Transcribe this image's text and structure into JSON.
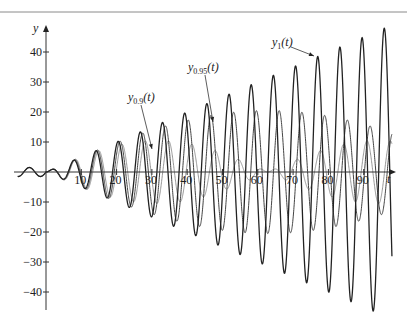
{
  "chart_data": {
    "type": "line",
    "title": "",
    "xlabel": "t",
    "ylabel": "y",
    "xlim": [
      -8,
      98
    ],
    "ylim": [
      -48,
      48
    ],
    "x_ticks": [
      10,
      20,
      30,
      40,
      50,
      60,
      70,
      80,
      90
    ],
    "y_ticks": [
      40,
      30,
      20,
      10,
      -10,
      -20,
      -30,
      -40
    ],
    "grid": false,
    "legend": "inline annotations with arrows",
    "series": [
      {
        "name": "y_1(t)",
        "label_main": "y",
        "label_sub": "1",
        "omega": 1.0,
        "color": "#222222",
        "width": 1.3,
        "formula": "(t/2) sin t",
        "peak_approx_values": [
          [
            77,
            38
          ],
          [
            84,
            42
          ],
          [
            90,
            45
          ],
          [
            95,
            48
          ]
        ]
      },
      {
        "name": "y_0.95(t)",
        "label_main": "y",
        "label_sub": "0.95",
        "omega": 0.95,
        "color": "#444444",
        "width": 1.0,
        "formula": "(cos 0.95t - cos t)/(1 - 0.95^2)",
        "amplitude_max": 20.5
      },
      {
        "name": "y_0.9(t)",
        "label_main": "y",
        "label_sub": "0.9",
        "omega": 0.9,
        "color": "#8a8a8a",
        "width": 0.9,
        "formula": "(cos 0.9t - cos t)/(1 - 0.9^2)",
        "amplitude_max": 10.5
      }
    ],
    "annotations": [
      {
        "text": "y_0.9(t)",
        "label_x": 128,
        "label_y": 101,
        "arrow_from": [
          141,
          105
        ],
        "arrow_to": [
          152,
          149
        ]
      },
      {
        "text": "y_0.95(t)",
        "label_x": 188,
        "label_y": 71,
        "arrow_from": [
          205,
          75
        ],
        "arrow_to": [
          213,
          122
        ]
      },
      {
        "text": "y_1(t)",
        "label_x": 272,
        "label_y": 46,
        "arrow_from": [
          291,
          47
        ],
        "arrow_to": [
          314,
          56
        ]
      }
    ]
  },
  "axes": {
    "x_var": "t",
    "y_var": "y",
    "x_tick_labels": [
      "10",
      "20",
      "30",
      "40",
      "50",
      "60",
      "70",
      "80",
      "90"
    ],
    "y_tick_labels": [
      "40",
      "30",
      "20",
      "10",
      "−10",
      "−20",
      "−30",
      "−40"
    ]
  },
  "layout": {
    "origin_px": [
      46,
      172
    ],
    "x_scale": 3.53,
    "y_scale": 3.0,
    "top_rule_y": 12,
    "top_rule_color": "#888888"
  }
}
